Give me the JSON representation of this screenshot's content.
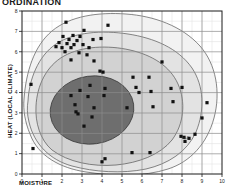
{
  "figure": {
    "title": "ORDINATION",
    "title_truncated": true
  },
  "axes": {
    "x": {
      "label": "MOISTURE",
      "ticks": [
        0,
        1,
        2,
        3,
        4,
        5,
        6,
        7,
        8,
        9,
        10
      ],
      "min": 0,
      "max": 10,
      "minor_per_major": 2
    },
    "y": {
      "label": "HEAT (LOCAL CLIMATE)",
      "ticks": [
        0,
        1,
        2,
        3,
        4,
        5,
        6,
        7,
        8
      ],
      "min": 0,
      "max": 8,
      "minor_per_major": 2
    }
  },
  "style": {
    "frame_color": "#1a1a1a",
    "major_grid_color": "#8a8a8a",
    "minor_grid_color": "#d8d8d8",
    "point_color": "#111111",
    "contour_line_color": "#3a3a3a",
    "envelope_outer_fill": "#f2f2f2",
    "envelope_mid_fill": "#dedede",
    "envelope_inner_fill": "#bdbdbd",
    "core_fill": "#6e6e6e",
    "background": "#ffffff"
  },
  "annotations": [
    {
      "text": "n=2",
      "x": 8.05,
      "y": 1.78
    }
  ],
  "chart_data": {
    "type": "scatter",
    "title": "ORDINATION",
    "xlabel": "MOISTURE",
    "ylabel": "HEAT (LOCAL CLIMATE)",
    "xlim": [
      0,
      10
    ],
    "ylim": [
      0,
      8
    ],
    "grid": true,
    "legend": "none",
    "series": [
      {
        "name": "sample plots",
        "marker": "filled-square",
        "points": [
          [
            2.2,
            7.45
          ],
          [
            3.1,
            7.05
          ],
          [
            4.3,
            7.3
          ],
          [
            2.05,
            6.75
          ],
          [
            2.55,
            6.8
          ],
          [
            2.9,
            6.75
          ],
          [
            2.35,
            6.6
          ],
          [
            2.75,
            6.55
          ],
          [
            3.55,
            6.6
          ],
          [
            3.95,
            6.65
          ],
          [
            1.85,
            6.45
          ],
          [
            2.25,
            6.4
          ],
          [
            2.6,
            6.35
          ],
          [
            3.05,
            6.35
          ],
          [
            1.7,
            6.25
          ],
          [
            2.0,
            6.2
          ],
          [
            2.45,
            6.2
          ],
          [
            3.35,
            6.2
          ],
          [
            2.15,
            6.0
          ],
          [
            2.85,
            5.95
          ],
          [
            3.25,
            5.85
          ],
          [
            2.45,
            5.6
          ],
          [
            3.6,
            5.55
          ],
          [
            7.0,
            5.5
          ],
          [
            3.9,
            5.05
          ],
          [
            4.05,
            5.0
          ],
          [
            0.45,
            4.4
          ],
          [
            5.55,
            4.75
          ],
          [
            6.35,
            4.75
          ],
          [
            3.4,
            4.35
          ],
          [
            4.15,
            4.2
          ],
          [
            5.7,
            4.25
          ],
          [
            7.45,
            4.2
          ],
          [
            8.0,
            4.25
          ],
          [
            2.9,
            4.1
          ],
          [
            5.85,
            4.0
          ],
          [
            6.45,
            4.05
          ],
          [
            2.45,
            3.85
          ],
          [
            3.3,
            3.8
          ],
          [
            4.1,
            3.85
          ],
          [
            7.55,
            3.55
          ],
          [
            9.25,
            3.5
          ],
          [
            2.65,
            3.4
          ],
          [
            3.6,
            3.25
          ],
          [
            5.25,
            3.25
          ],
          [
            6.55,
            3.3
          ],
          [
            2.7,
            3.05
          ],
          [
            2.8,
            2.95
          ],
          [
            3.5,
            2.8
          ],
          [
            9.0,
            2.75
          ],
          [
            3.1,
            2.35
          ],
          [
            7.95,
            1.85
          ],
          [
            8.1,
            1.8
          ],
          [
            8.35,
            1.75
          ],
          [
            8.65,
            1.95
          ],
          [
            8.15,
            1.6
          ],
          [
            0.55,
            1.25
          ],
          [
            5.5,
            1.05
          ],
          [
            6.4,
            1.05
          ],
          [
            4.15,
            0.75
          ],
          [
            4.0,
            0.6
          ]
        ]
      }
    ],
    "contours": [
      {
        "name": "outer-envelope",
        "level": 1
      },
      {
        "name": "mid-envelope",
        "level": 2
      },
      {
        "name": "inner-envelope",
        "level": 3
      },
      {
        "name": "core",
        "level": 4
      }
    ]
  }
}
